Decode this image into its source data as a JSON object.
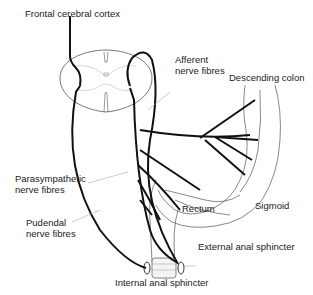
{
  "diagram": {
    "labels": {
      "frontal_cortex": "Frontal cerebral cortex",
      "afferent_line1": "Afferent",
      "afferent_line2": "nerve fibres",
      "descending_colon": "Descending colon",
      "parasympathetic_line1": "Parasympathetic",
      "parasympathetic_line2": "nerve fibres",
      "pudendal_line1": "Pudendal",
      "pudendal_line2": "nerve fibres",
      "rectum": "Rectum",
      "sigmoid": "Sigmoid",
      "external_sphincter": "External anal sphincter",
      "internal_sphincter": "Internal anal sphincter"
    },
    "colors": {
      "nerve": "#111111",
      "outline": "#555555",
      "leader": "#aaaaaa",
      "text": "#222222"
    }
  }
}
